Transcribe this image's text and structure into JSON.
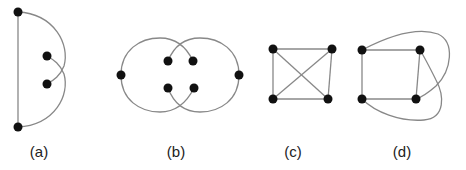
{
  "figures": [
    {
      "id": "a",
      "label": "(a)",
      "nodes": 4,
      "description": "vertical edge with two crossing arcs to inner nodes"
    },
    {
      "id": "b",
      "label": "(b)",
      "nodes": 6,
      "description": "two overlapping circles with crossing arcs"
    },
    {
      "id": "c",
      "label": "(c)",
      "nodes": 4,
      "description": "square with both diagonals (K4)"
    },
    {
      "id": "d",
      "label": "(d)",
      "nodes": 4,
      "description": "square with two external crossing curves"
    }
  ],
  "colors": {
    "edge": "#888888",
    "node": "#111111",
    "label": "#222222"
  }
}
